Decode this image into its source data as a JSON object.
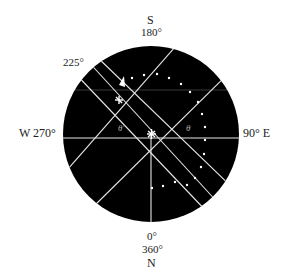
{
  "diagram": {
    "labels": {
      "south_letter": "S",
      "south_deg": "180°",
      "sw_deg": "225°",
      "west": "W  270°",
      "east": "90°  E",
      "north_deg0": "0°",
      "north_deg360": "360°",
      "north_letter": "N",
      "angle_prime": "θ'",
      "angle_theta": "θ"
    },
    "colors": {
      "disk": "#000000",
      "lines": "#e6e6e6",
      "text": "#222222"
    }
  }
}
